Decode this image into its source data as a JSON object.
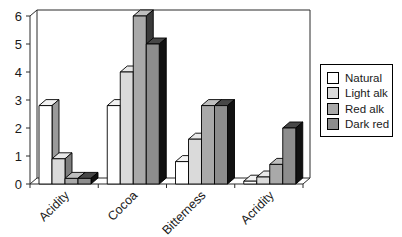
{
  "chart_data": {
    "type": "bar",
    "subtype": "3d-clustered-bars",
    "title": "",
    "xlabel": "",
    "ylabel": "",
    "categories": [
      "Acidity",
      "Cocoa",
      "Bitterness",
      "Acridity"
    ],
    "series": [
      {
        "name": "Natural",
        "values": [
          2.8,
          2.8,
          0.8,
          0.1
        ],
        "colors": {
          "front": "#ffffff",
          "top": "#f2f2f2",
          "side": "#9a9a9a"
        }
      },
      {
        "name": "Light alk",
        "values": [
          0.9,
          4.0,
          1.6,
          0.25
        ],
        "colors": {
          "front": "#dadada",
          "top": "#e8e8e8",
          "side": "#7d7d7d"
        }
      },
      {
        "name": "Red alk",
        "values": [
          0.2,
          6.0,
          2.8,
          0.7
        ],
        "colors": {
          "front": "#a9a9a9",
          "top": "#bebebe",
          "side": "#3a3a3a"
        }
      },
      {
        "name": "Dark red",
        "values": [
          0.2,
          5.0,
          2.8,
          2.0
        ],
        "colors": {
          "front": "#8d8d8d",
          "top": "#474747",
          "side": "#111111"
        }
      }
    ],
    "ylim": [
      0,
      6
    ],
    "ytick_labels": [
      "0",
      "1",
      "2",
      "3",
      "4",
      "5",
      "6"
    ],
    "grid": false,
    "legend_position": "right",
    "legend_labels": [
      "Natural",
      "Light alk",
      "Red alk",
      "Dark red"
    ]
  },
  "colors": {
    "background": "#ffffff",
    "axis": "#2a2a2a",
    "text": "#1a1a1a"
  }
}
